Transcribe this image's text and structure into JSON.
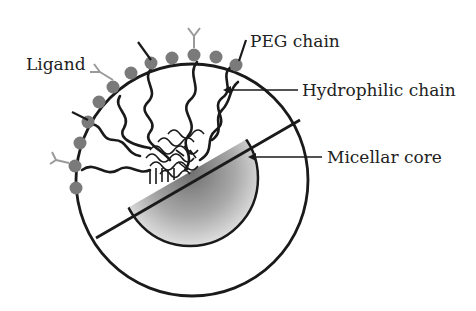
{
  "diagram": {
    "labels": {
      "ligand": "Ligand",
      "peg_chain": "PEG chain",
      "hydrophilic_chain": "Hydrophilic chain",
      "micellar_core": "Micellar core"
    },
    "colors": {
      "outline": "#1a1a1a",
      "peg_bead": "#7a7a7a",
      "ligand": "#9a9a9a",
      "core_center": "#6e6e6e",
      "core_edge": "#e8e8e8"
    }
  }
}
